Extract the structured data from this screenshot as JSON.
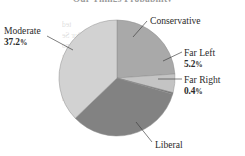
{
  "chart_data": {
    "type": "pie",
    "title": "Our Things Probability",
    "xlabel": "",
    "ylabel": "",
    "legend_position": "callout-labels",
    "grid": false,
    "categories": [
      "Conservative",
      "Far Left",
      "Far Right",
      "Liberal",
      "Moderate"
    ],
    "values": [
      23.9,
      5.2,
      0.4,
      33.3,
      37.2
    ],
    "labels_shown": [
      "Conservative",
      "Far Left",
      "Far Right",
      "Liberal",
      "Moderate"
    ],
    "value_labels_shown": [
      "",
      "5.2%",
      "0.4%",
      "",
      "37.2%"
    ],
    "colors": [
      "#a9a9a9",
      "#c4c4c4",
      "#6d6d6d",
      "#828282",
      "#d2d2d2"
    ],
    "slices": [
      {
        "name": "Conservative",
        "value": 23.9,
        "label": "Conservative",
        "pct_label": "",
        "color": "#a9a9a9",
        "start_deg": 0.0,
        "end_deg": 86.0
      },
      {
        "name": "Far Left",
        "value": 5.2,
        "label": "Far Left",
        "pct_label": "5.2%",
        "color": "#c4c4c4",
        "start_deg": 86.0,
        "end_deg": 104.7
      },
      {
        "name": "Far Right",
        "value": 0.4,
        "label": "Far Right",
        "pct_label": "0.4%",
        "color": "#6d6d6d",
        "start_deg": 104.7,
        "end_deg": 106.2
      },
      {
        "name": "Liberal",
        "value": 33.3,
        "label": "Liberal",
        "pct_label": "",
        "color": "#828282",
        "start_deg": 106.2,
        "end_deg": 226.1
      },
      {
        "name": "Moderate",
        "value": 37.2,
        "label": "Moderate",
        "pct_label": "37.2%",
        "color": "#d2d2d2",
        "start_deg": 226.1,
        "end_deg": 360.0
      }
    ]
  },
  "title": {
    "text": "Our Things Probability"
  },
  "labels": {
    "conservative": {
      "name": "Conservative",
      "pct": ""
    },
    "far_left": {
      "name": "Far Left",
      "pct": "5.2",
      "symbol": "%"
    },
    "far_right": {
      "name": "Far Right",
      "pct": "0.4",
      "symbol": "%"
    },
    "moderate": {
      "name": "Moderate",
      "pct": "37.2",
      "symbol": "%"
    },
    "liberal": {
      "name": "Liberal",
      "pct": ""
    }
  },
  "bleed_through": {
    "lines": [
      "ted",
      "Our Se",
      "sno",
      "mutDy",
      "anolD",
      "to IX",
      "nnpO",
      "and"
    ]
  }
}
